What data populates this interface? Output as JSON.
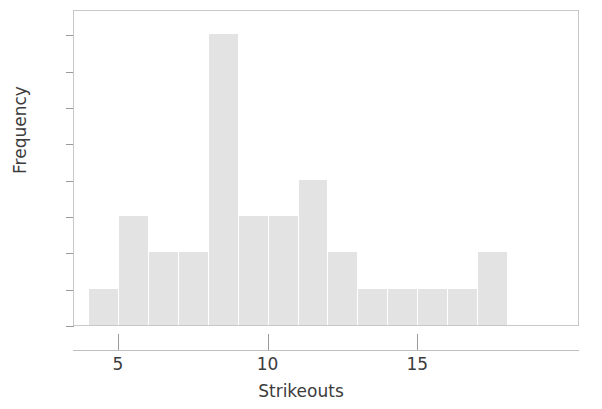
{
  "chart_data": {
    "type": "bar",
    "title": "",
    "subtitle": "",
    "xlabel": "Strikeouts",
    "ylabel": "Frequency",
    "categories": [
      4,
      5,
      6,
      7,
      8,
      9,
      10,
      11,
      12,
      13,
      14,
      15,
      16,
      17
    ],
    "values": [
      1,
      3,
      2,
      2,
      8,
      3,
      3,
      4,
      2,
      1,
      1,
      1,
      1,
      2
    ],
    "bin_width": 1,
    "bin_edges": [
      4,
      5,
      6,
      7,
      8,
      9,
      10,
      11,
      12,
      13,
      14,
      15,
      16,
      17,
      18
    ],
    "xlim": [
      3.5,
      20.4
    ],
    "ylim": [
      0,
      8.7
    ],
    "x_ticks": [
      5,
      10,
      15
    ],
    "x_tick_labels": [
      "5",
      "10",
      "15"
    ],
    "y_ticks": [
      0,
      1,
      2,
      3,
      4,
      5,
      6,
      7,
      8
    ],
    "y_tick_labels": [
      "0",
      "1",
      "2",
      "3",
      "4",
      "5",
      "6",
      "7",
      "8"
    ],
    "grid": false,
    "legend": false,
    "bar_color": "#e3e3e3",
    "frame_color": "#c8c8c8",
    "text_color": "#3c3c3c"
  },
  "axes": {
    "x_title": "Strikeouts",
    "y_title": "Frequency"
  }
}
